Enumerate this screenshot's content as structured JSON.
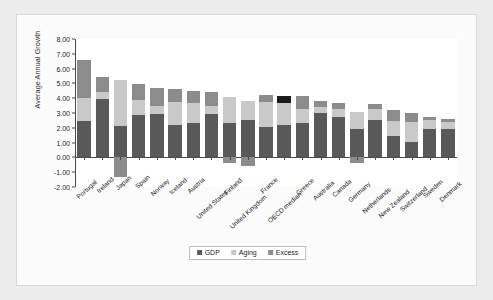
{
  "figure": {
    "y_axis_title": "Average Annual Growth"
  },
  "legend": {
    "items": [
      {
        "label": "GDP",
        "color": "#595959"
      },
      {
        "label": "Aging",
        "color": "#c9c9c9"
      },
      {
        "label": "Excess",
        "color": "#8c8c8c"
      }
    ]
  },
  "colors": {
    "gdp": "#595959",
    "aging": "#c9c9c9",
    "excess": "#8c8c8c",
    "highlight": "#1a1a1a",
    "axis": "#4a4a4a",
    "plot_background": "#ffffff",
    "panel_background": "#fbfbfb",
    "figure_background": "#ececec"
  },
  "chart_data": {
    "type": "bar",
    "subtype": "stacked",
    "title": "",
    "xlabel": "",
    "ylabel": "Average Annual Growth",
    "ylim": [
      -2.0,
      8.0
    ],
    "yticks": [
      -2.0,
      -1.0,
      0.0,
      1.0,
      2.0,
      3.0,
      4.0,
      5.0,
      6.0,
      7.0,
      8.0
    ],
    "ytick_labels": [
      "-2.00",
      "-1.00",
      "0.00",
      "1.00",
      "2.00",
      "3.00",
      "4.00",
      "5.00",
      "6.00",
      "7.00",
      "8.00"
    ],
    "grid": false,
    "legend_position": "bottom",
    "categories": [
      "Portugal",
      "Ireland",
      "Japan",
      "Spain",
      "Norway",
      "Iceland",
      "Austria",
      "United States",
      "Finland",
      "United Kingdom",
      "France",
      "OECD median",
      "Greece",
      "Australia",
      "Canada",
      "Germany",
      "Netherlands",
      "New Zealand",
      "Switzerland",
      "Sweden",
      "Denmark"
    ],
    "highlight_category": "OECD median",
    "series": [
      {
        "name": "GDP",
        "values": [
          2.45,
          3.95,
          2.15,
          2.85,
          2.95,
          2.2,
          2.35,
          2.95,
          2.35,
          2.5,
          2.05,
          2.2,
          2.35,
          3.0,
          2.7,
          1.95,
          2.55,
          1.45,
          1.05,
          1.95,
          1.95
        ]
      },
      {
        "name": "Aging",
        "values": [
          1.55,
          0.5,
          3.05,
          1.0,
          0.55,
          1.55,
          1.35,
          0.55,
          1.7,
          1.3,
          1.7,
          1.45,
          0.95,
          0.4,
          0.55,
          1.15,
          0.75,
          1.0,
          1.35,
          0.55,
          0.45
        ]
      },
      {
        "name": "Excess",
        "values": [
          2.6,
          1.0,
          -1.35,
          1.1,
          1.2,
          0.85,
          0.8,
          0.95,
          -0.4,
          -0.55,
          0.45,
          0.5,
          0.85,
          0.4,
          0.45,
          -0.35,
          0.3,
          0.75,
          0.6,
          0.2,
          0.2
        ]
      }
    ],
    "totals": [
      6.6,
      5.45,
      5.2,
      4.95,
      4.7,
      4.6,
      4.5,
      4.45,
      4.05,
      3.8,
      4.2,
      4.15,
      4.15,
      3.8,
      3.7,
      3.1,
      3.6,
      3.2,
      3.0,
      2.7,
      2.6
    ]
  }
}
